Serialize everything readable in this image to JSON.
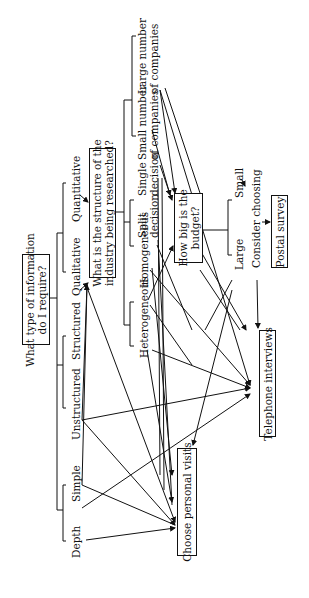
{
  "diagram": {
    "orientation": "rotated 90 degrees counter-clockwise",
    "root_question": "What type of information\ndo I require?",
    "info_types": {
      "depth": "Depth",
      "simple": "Simple",
      "unstructured": "Unstructured",
      "structured": "Structured",
      "qualitative": "Qualitative",
      "quantitative": "Quantitative"
    },
    "industry_question": "What is the structure of the\nindustry being researched?",
    "industry_types": {
      "heterogeneous": "Heterogeneous",
      "homogeneous": "Homogeneous",
      "split_decision": "Split\ndecision",
      "single_decision": "Single\ndecision",
      "small_number": "Small number\nof companies",
      "large_number": "Large number\nof companies"
    },
    "budget_question": "How big is the\nbudget?",
    "budget_sizes": {
      "large": "Large",
      "small": "Small"
    },
    "consider_choosing": "Consider choosing",
    "outcomes": {
      "postal": "Postal survey",
      "telephone": "Telephone interviews",
      "personal": "Choose personal visits"
    }
  }
}
